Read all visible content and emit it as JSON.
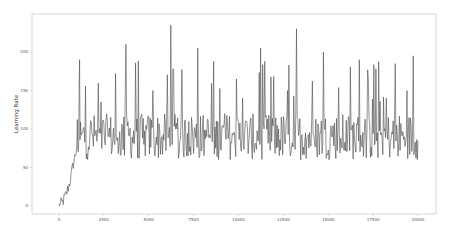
{
  "chart_data": {
    "type": "line",
    "title": "",
    "xlabel": "",
    "ylabel": "Learning Rate",
    "xlim": [
      -1500,
      21000
    ],
    "ylim": [
      -10,
      245
    ],
    "xticks": [
      0,
      2500,
      5000,
      7500,
      10000,
      12500,
      15000,
      17500,
      20000
    ],
    "xtick_labels": [
      "0",
      "2500",
      "5000",
      "7500",
      "10000",
      "12500",
      "15000",
      "17500",
      "20000"
    ],
    "yticks": [
      0,
      50,
      100,
      150,
      200
    ],
    "ytick_labels": [
      "0",
      "50",
      "100",
      "150",
      "200"
    ],
    "grid": false,
    "legend": null,
    "line_color": "#4a4a4a",
    "series": [
      {
        "name": "learning_rate",
        "description": "Noisy trace: ramps from ~0 at step 0 to ~90 by step ~1000, then oscillates roughly between 40 and 140 with frequent spikes up to ~235 through step 20000",
        "x": [
          0,
          200,
          400,
          600,
          800,
          1000,
          1100,
          1200,
          1400,
          1600,
          2000,
          2500,
          3000,
          3500,
          4000,
          4500,
          5000,
          5500,
          6000,
          6500,
          7000,
          7500,
          8000,
          8500,
          9000,
          9500,
          10000,
          10500,
          11000,
          11500,
          12000,
          12500,
          13000,
          13500,
          14000,
          14500,
          15000,
          15500,
          16000,
          16500,
          17000,
          17500,
          18000,
          18500,
          19000,
          19500,
          20000
        ],
        "values": [
          0,
          5,
          15,
          30,
          55,
          75,
          190,
          95,
          140,
          110,
          95,
          90,
          85,
          210,
          95,
          80,
          150,
          90,
          235,
          85,
          110,
          205,
          90,
          75,
          120,
          95,
          140,
          80,
          205,
          90,
          100,
          150,
          230,
          95,
          85,
          200,
          90,
          80,
          110,
          190,
          85,
          95,
          140,
          185,
          90,
          195,
          85
        ]
      }
    ]
  }
}
